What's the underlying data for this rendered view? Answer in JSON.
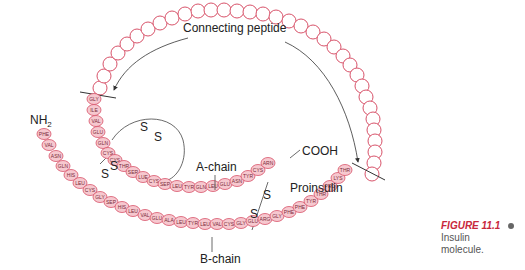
{
  "labels": {
    "connecting_peptide": "Connecting peptide",
    "a_chain": "A-chain",
    "b_chain": "B-chain",
    "proinsulin": "Proinsulin",
    "cooh": "COOH",
    "nh2_main": "NH",
    "nh2_sub": "2",
    "s": "S"
  },
  "caption": {
    "figure": "FIGURE 11.1",
    "text_line1": "Insulin",
    "text_line2": "molecule."
  },
  "colors": {
    "residue_fill": "#f6c8cf",
    "residue_stroke": "#d8536a",
    "caption_accent": "#c8283c"
  },
  "chains": {
    "a_chain_upper": [
      "GLY",
      "ILE",
      "VAL",
      "GLU",
      "GLN",
      "CYS"
    ],
    "a_chain_lower": [
      "CYS",
      "THR",
      "SER",
      "LUE",
      "CYS",
      "SEP",
      "LEU",
      "TYR",
      "GLN",
      "LEU",
      "GLU",
      "ASN",
      "TYR",
      "CYS",
      "ARN"
    ],
    "b_chain": [
      "PHE",
      "VAL",
      "ASN",
      "GLN",
      "HIS",
      "LEU",
      "CYS",
      "GLY",
      "SEP",
      "HIS",
      "LEU",
      "VAL",
      "GLU",
      "ALA",
      "LEU",
      "TYR",
      "LEU",
      "VAL",
      "CYS",
      "GLY",
      "GLU",
      "ARG",
      "GLY",
      "PHE",
      "PHE",
      "TYR",
      "THR",
      "PRO",
      "LYS",
      "THR"
    ]
  }
}
